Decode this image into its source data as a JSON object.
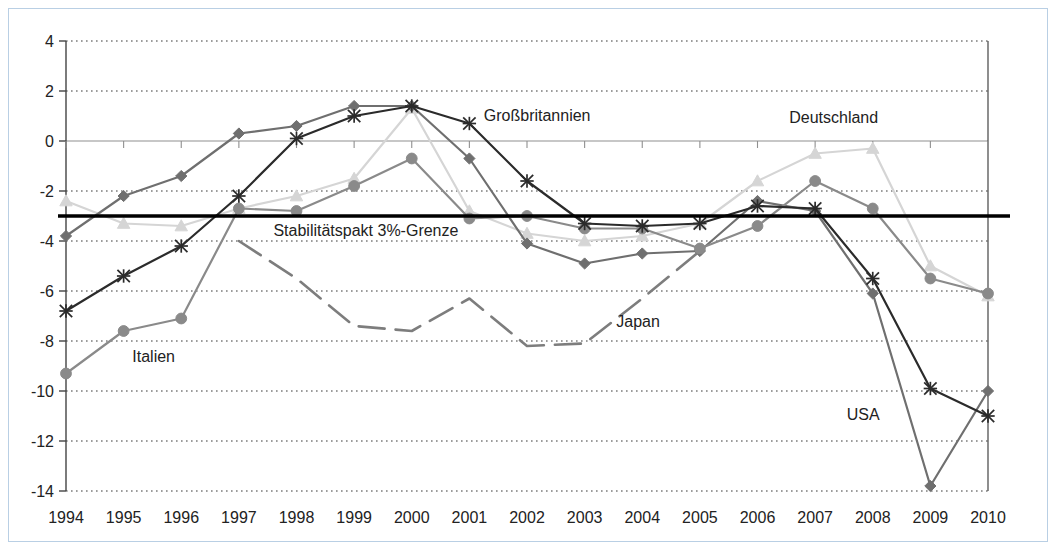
{
  "chart_data": {
    "type": "line",
    "title": "",
    "subtitle": "",
    "xlabel": "",
    "ylabel": "",
    "grid": true,
    "legend_position": "inline-annotations",
    "x": [
      1994,
      1995,
      1996,
      1997,
      1998,
      1999,
      2000,
      2001,
      2002,
      2003,
      2004,
      2005,
      2006,
      2007,
      2008,
      2009,
      2010
    ],
    "xtick_labels": [
      "1994",
      "1995",
      "1996",
      "1997",
      "1998",
      "1999",
      "2000",
      "2001",
      "2002",
      "2003",
      "2004",
      "2005",
      "2006",
      "2007",
      "2008",
      "2009",
      "2010"
    ],
    "ytick_labels": [
      "4",
      "2",
      "0",
      "-2",
      "-4",
      "-6",
      "-8",
      "-10",
      "-12",
      "-14"
    ],
    "yticks": [
      4,
      2,
      0,
      -2,
      -4,
      -6,
      -8,
      -10,
      -12,
      -14
    ],
    "ylim": [
      -14,
      4
    ],
    "xlim": [
      1994,
      2010
    ],
    "reference_line": {
      "label": "Stabilitätspakt 3%-Grenze",
      "value": -3.0,
      "color": "#000000"
    },
    "series": [
      {
        "name": "Deutschland",
        "color": "#d5d5d5",
        "marker": "triangle",
        "label_x": 2006.55,
        "label_y": 0.72,
        "values": [
          -2.4,
          -3.3,
          -3.4,
          -2.7,
          -2.2,
          -1.5,
          1.3,
          -2.8,
          -3.7,
          -4.0,
          -3.8,
          -3.3,
          -1.6,
          -0.5,
          -0.3,
          -5.0,
          -6.2
        ]
      },
      {
        "name": "Großbritannien",
        "color": "#2b2b2b",
        "marker": "cross",
        "label_x": 2001.25,
        "label_y": 0.82,
        "values": [
          -6.8,
          -5.4,
          -4.2,
          -2.2,
          0.1,
          1.0,
          1.4,
          0.7,
          -1.6,
          -3.3,
          -3.4,
          -3.3,
          -2.6,
          -2.7,
          -5.5,
          -9.9,
          -11.0
        ]
      },
      {
        "name": "Italien",
        "color": "#8a8a8a",
        "marker": "circle",
        "label_x": 1995.15,
        "label_y": -8.85,
        "values": [
          -9.3,
          -7.6,
          -7.1,
          -2.7,
          -2.8,
          -1.8,
          -0.7,
          -3.1,
          -3.0,
          -3.5,
          -3.5,
          -4.3,
          -3.4,
          -1.6,
          -2.7,
          -5.5,
          -6.1
        ]
      },
      {
        "name": "USA",
        "color": "#6f6f6f",
        "marker": "diamond",
        "label_x": 2007.55,
        "label_y": -11.15,
        "values": [
          -3.8,
          -2.2,
          -1.4,
          0.3,
          0.6,
          1.4,
          1.4,
          -0.7,
          -4.1,
          -4.9,
          -4.5,
          -4.4,
          -2.4,
          -2.8,
          -6.1,
          -13.8,
          -10.0
        ]
      },
      {
        "name": "Japan",
        "color": "#7d7d7d",
        "marker": "none",
        "dashed": true,
        "label_x": 2003.55,
        "label_y": -7.45,
        "values": [
          null,
          null,
          null,
          -4.0,
          -5.5,
          -7.4,
          -7.6,
          -6.3,
          -8.2,
          -8.1,
          -6.3,
          -4.4,
          null,
          null,
          null,
          null,
          null
        ]
      }
    ]
  },
  "annotations": {
    "reference_label": "Stabilitätspakt 3%-Grenze",
    "deutschland": "Deutschland",
    "grossbritannien": "Großbritannien",
    "italien": "Italien",
    "usa": "USA",
    "japan": "Japan"
  }
}
